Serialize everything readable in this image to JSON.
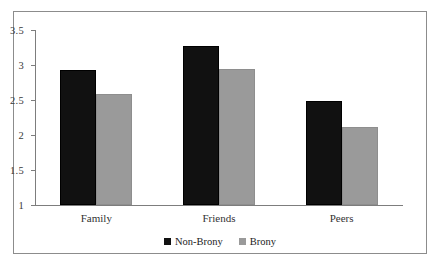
{
  "chart_data": {
    "type": "bar",
    "title": "",
    "subtitle": "",
    "xlabel": "",
    "ylabel": "",
    "categories": [
      "Family",
      "Friends",
      "Peers"
    ],
    "series": [
      {
        "name": "Non-Brony",
        "color": "#111111",
        "values": [
          2.93,
          3.27,
          2.48
        ]
      },
      {
        "name": "Brony",
        "color": "#9a9a9a",
        "values": [
          2.58,
          2.94,
          2.12
        ]
      }
    ],
    "ylim": [
      1,
      3.5
    ],
    "ytick_values": [
      3.5,
      3,
      2.5,
      2,
      1.5,
      1
    ],
    "ytick_labels": [
      "3.5",
      "3",
      "2.5",
      "2",
      "1.5",
      "1"
    ],
    "grid": false,
    "legend_position": "bottom-center",
    "border": true,
    "border_color": "#8c8c8c",
    "axis_color": "#7d7d7d",
    "background": "#ffffff"
  },
  "legend": {
    "items": [
      {
        "label": "Non-Brony",
        "swatch_icon": "square-marker-black",
        "color": "#111111"
      },
      {
        "label": "Brony",
        "swatch_icon": "square-marker-gray",
        "color": "#9a9a9a"
      }
    ]
  }
}
